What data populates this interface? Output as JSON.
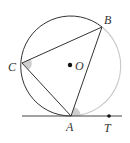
{
  "figure": {
    "type": "circle-tangent-inscribed-angle",
    "colors": {
      "stroke": "#333333",
      "arc_highlight": "#c8c8c8",
      "angle_fill": "#cfcfcf",
      "point": "#111111"
    },
    "circle": {
      "center_label": "O",
      "cx": 71,
      "cy": 66,
      "r": 50
    },
    "points": {
      "A": {
        "label": "A",
        "x": 71,
        "y": 116
      },
      "B": {
        "label": "B",
        "x": 102,
        "y": 27
      },
      "C": {
        "label": "C",
        "x": 22,
        "y": 63
      },
      "T": {
        "label": "T",
        "x": 109,
        "y": 116
      },
      "O": {
        "label": "O",
        "x": 71,
        "y": 65
      }
    },
    "segments": [
      "AB",
      "BC",
      "CA"
    ],
    "tangent_line": {
      "through": "A",
      "x1": 22,
      "x2": 122,
      "y": 116
    },
    "marked_angles": [
      "BCA",
      "BAT"
    ],
    "highlighted_arc": "AB"
  }
}
